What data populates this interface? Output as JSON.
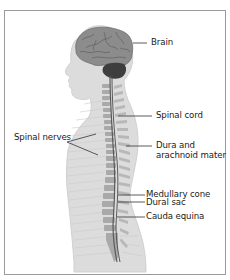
{
  "diagram": {
    "labels": {
      "brain": "Brain",
      "spinal_cord": "Spinal cord",
      "spinal_nerves": "Spinal nerves",
      "dura_line1": "Dura and",
      "dura_line2": "arachnoid mater",
      "medullary_cone": "Medullary cone",
      "dural_sac": "Dural sac",
      "cauda_equina": "Cauda equina"
    },
    "colors": {
      "body": "#dcdcdc",
      "body_outline": "#cfcfcf",
      "brain": "#8a8a8a",
      "cerebellum": "#3d3d3d",
      "vertebrae": "#a9a9a9",
      "cord": "#555555",
      "leader": "#333333",
      "frame": "#9a9a9a"
    }
  }
}
